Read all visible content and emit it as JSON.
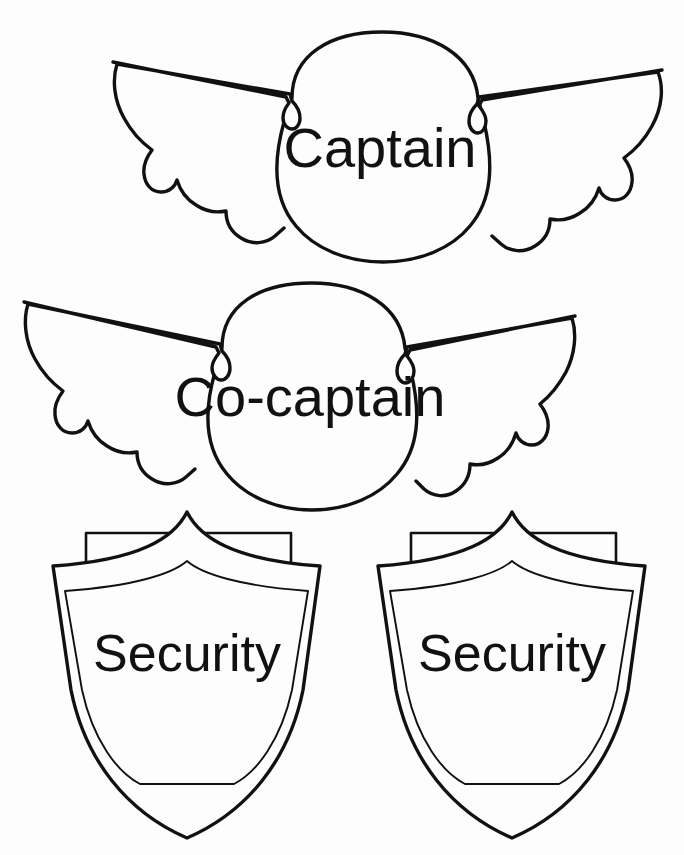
{
  "page": {
    "kind": "printable-badge-template-sheet",
    "background_color": "#fdfdfd",
    "line_color": "#111111",
    "width": 684,
    "height": 855
  },
  "badges": [
    {
      "id": "captain",
      "shape": "winged-wings-badge",
      "label": "Captain",
      "label_font_size": 56,
      "label_center_x": 380,
      "label_baseline_y": 167,
      "outline_color": "#111111",
      "fill_color": "#fdfdfd"
    },
    {
      "id": "co-captain",
      "shape": "winged-wings-badge",
      "label": "Co-captain",
      "label_font_size": 56,
      "label_center_x": 310,
      "label_baseline_y": 416,
      "outline_color": "#111111",
      "fill_color": "#fdfdfd"
    },
    {
      "id": "security-left",
      "shape": "shield-badge",
      "label": "Security",
      "label_font_size": 52,
      "label_center_x": 187,
      "label_baseline_y": 671,
      "outline_color": "#111111",
      "fill_color": "#fdfdfd"
    },
    {
      "id": "security-right",
      "shape": "shield-badge",
      "label": "Security",
      "label_font_size": 52,
      "label_center_x": 512,
      "label_baseline_y": 671,
      "outline_color": "#111111",
      "fill_color": "#fdfdfd"
    }
  ],
  "geometry": {
    "captain_wing_left_tip": [
      113,
      62
    ],
    "captain_wing_right_tip": [
      662,
      70
    ],
    "cocaptain_wing_left_tip": [
      24,
      302
    ],
    "cocaptain_wing_right_tip": [
      575,
      316
    ],
    "shield_left_bounds": [
      53,
      512,
      320,
      838
    ],
    "shield_right_bounds": [
      378,
      512,
      645,
      838
    ]
  }
}
